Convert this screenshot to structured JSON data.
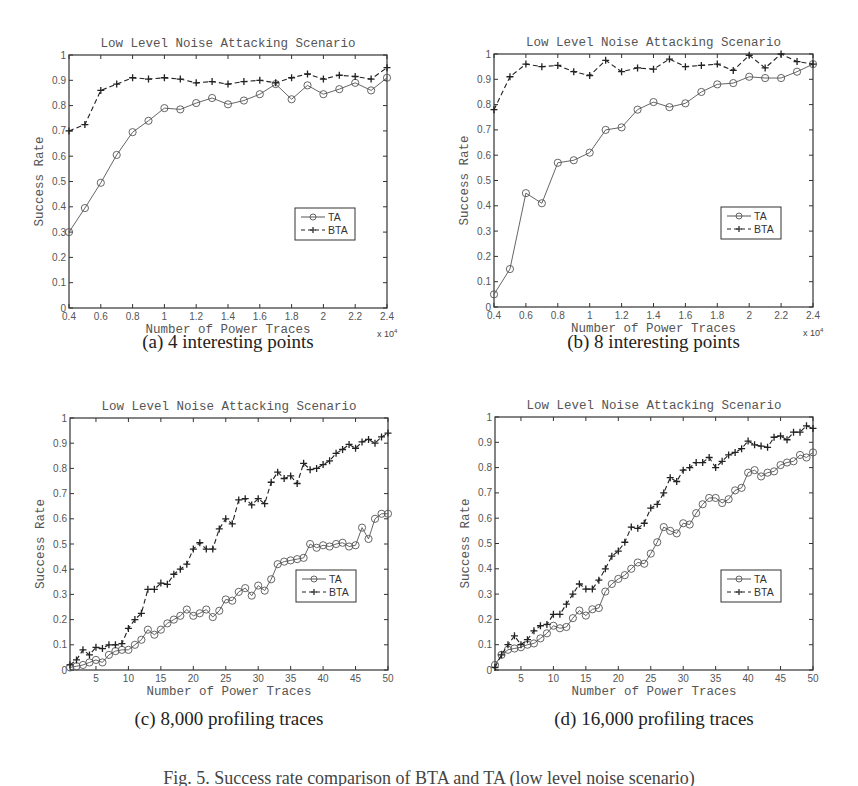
{
  "figure": {
    "caption": "Fig. 5. Success rate comparison of BTA and TA (low level noise scenario)",
    "panels": [
      {
        "id": "a",
        "caption": "(a) 4 interesting points"
      },
      {
        "id": "b",
        "caption": "(b) 8 interesting points"
      },
      {
        "id": "c",
        "caption": "(c) 8,000 profiling traces"
      },
      {
        "id": "d",
        "caption": "(d) 16,000 profiling traces"
      }
    ]
  },
  "chart_data": [
    {
      "panel": "a",
      "type": "line",
      "title": "Low Level Noise Attacking Scenario",
      "xlabel": "Number of Power Traces",
      "ylabel": "Success Rate",
      "x_multiplier_label": "x 10^4",
      "xlim": [
        0.4,
        2.4
      ],
      "ylim": [
        0,
        1
      ],
      "xticks": [
        0.4,
        0.6,
        0.8,
        1,
        1.2,
        1.4,
        1.6,
        1.8,
        2,
        2.2,
        2.4
      ],
      "yticks": [
        0,
        0.1,
        0.2,
        0.3,
        0.4,
        0.5,
        0.6,
        0.7,
        0.8,
        0.9,
        1
      ],
      "grid": false,
      "legend_position": "lower right",
      "x": [
        0.4,
        0.5,
        0.6,
        0.7,
        0.8,
        0.9,
        1.0,
        1.1,
        1.2,
        1.3,
        1.4,
        1.5,
        1.6,
        1.7,
        1.8,
        1.9,
        2.0,
        2.1,
        2.2,
        2.3,
        2.4
      ],
      "series": [
        {
          "name": "TA",
          "style": "solid-circle",
          "values": [
            0.3,
            0.395,
            0.495,
            0.605,
            0.695,
            0.74,
            0.79,
            0.785,
            0.81,
            0.83,
            0.805,
            0.82,
            0.845,
            0.885,
            0.825,
            0.88,
            0.845,
            0.865,
            0.89,
            0.86,
            0.91
          ]
        },
        {
          "name": "BTA",
          "style": "dashed-plus",
          "values": [
            0.7,
            0.725,
            0.86,
            0.885,
            0.91,
            0.905,
            0.91,
            0.905,
            0.89,
            0.895,
            0.885,
            0.895,
            0.9,
            0.89,
            0.91,
            0.925,
            0.905,
            0.92,
            0.915,
            0.905,
            0.95
          ]
        }
      ]
    },
    {
      "panel": "b",
      "type": "line",
      "title": "Low Level Noise Attacking Scenario",
      "xlabel": "Number of Power Traces",
      "ylabel": "Success Rate",
      "x_multiplier_label": "x 10^4",
      "xlim": [
        0.4,
        2.4
      ],
      "ylim": [
        0,
        1
      ],
      "xticks": [
        0.4,
        0.6,
        0.8,
        1,
        1.2,
        1.4,
        1.6,
        1.8,
        2,
        2.2,
        2.4
      ],
      "yticks": [
        0,
        0.1,
        0.2,
        0.3,
        0.4,
        0.5,
        0.6,
        0.7,
        0.8,
        0.9,
        1
      ],
      "grid": false,
      "legend_position": "lower right",
      "x": [
        0.4,
        0.5,
        0.6,
        0.7,
        0.8,
        0.9,
        1.0,
        1.1,
        1.2,
        1.3,
        1.4,
        1.5,
        1.6,
        1.7,
        1.8,
        1.9,
        2.0,
        2.1,
        2.2,
        2.3,
        2.4
      ],
      "series": [
        {
          "name": "TA",
          "style": "solid-circle",
          "values": [
            0.05,
            0.15,
            0.45,
            0.41,
            0.57,
            0.58,
            0.61,
            0.7,
            0.71,
            0.78,
            0.81,
            0.79,
            0.805,
            0.85,
            0.88,
            0.885,
            0.91,
            0.905,
            0.905,
            0.93,
            0.96
          ]
        },
        {
          "name": "BTA",
          "style": "dashed-plus",
          "values": [
            0.78,
            0.91,
            0.96,
            0.95,
            0.955,
            0.93,
            0.915,
            0.975,
            0.93,
            0.945,
            0.94,
            0.98,
            0.95,
            0.955,
            0.96,
            0.935,
            0.995,
            0.945,
            1.0,
            0.97,
            0.96
          ]
        }
      ]
    },
    {
      "panel": "c",
      "type": "line",
      "title": "Low Level Noise Attacking Scenario",
      "xlabel": "Number of Power Traces",
      "ylabel": "Success Rate",
      "xlim": [
        1,
        50
      ],
      "ylim": [
        0,
        1
      ],
      "xticks": [
        5,
        10,
        15,
        20,
        25,
        30,
        35,
        40,
        45,
        50
      ],
      "yticks": [
        0,
        0.1,
        0.2,
        0.3,
        0.4,
        0.5,
        0.6,
        0.7,
        0.8,
        0.9,
        1
      ],
      "grid": false,
      "legend_position": "lower right",
      "x": [
        1,
        2,
        3,
        4,
        5,
        6,
        7,
        8,
        9,
        10,
        11,
        12,
        13,
        14,
        15,
        16,
        17,
        18,
        19,
        20,
        21,
        22,
        23,
        24,
        25,
        26,
        27,
        28,
        29,
        30,
        31,
        32,
        33,
        34,
        35,
        36,
        37,
        38,
        39,
        40,
        41,
        42,
        43,
        44,
        45,
        46,
        47,
        48,
        49,
        50
      ],
      "series": [
        {
          "name": "TA",
          "style": "solid-circle",
          "values": [
            0.01,
            0.015,
            0.02,
            0.03,
            0.04,
            0.03,
            0.06,
            0.075,
            0.08,
            0.08,
            0.1,
            0.12,
            0.16,
            0.14,
            0.16,
            0.185,
            0.2,
            0.215,
            0.24,
            0.215,
            0.225,
            0.24,
            0.21,
            0.235,
            0.28,
            0.275,
            0.31,
            0.325,
            0.295,
            0.335,
            0.315,
            0.36,
            0.42,
            0.43,
            0.435,
            0.44,
            0.445,
            0.5,
            0.485,
            0.495,
            0.49,
            0.5,
            0.505,
            0.49,
            0.495,
            0.565,
            0.52,
            0.6,
            0.62,
            0.62
          ]
        },
        {
          "name": "BTA",
          "style": "dashed-plus",
          "values": [
            0.02,
            0.04,
            0.08,
            0.06,
            0.09,
            0.085,
            0.1,
            0.1,
            0.105,
            0.165,
            0.2,
            0.225,
            0.32,
            0.32,
            0.345,
            0.34,
            0.38,
            0.4,
            0.42,
            0.48,
            0.505,
            0.48,
            0.48,
            0.56,
            0.6,
            0.58,
            0.675,
            0.68,
            0.655,
            0.68,
            0.66,
            0.745,
            0.785,
            0.76,
            0.77,
            0.74,
            0.82,
            0.795,
            0.8,
            0.815,
            0.83,
            0.86,
            0.875,
            0.895,
            0.88,
            0.905,
            0.915,
            0.9,
            0.925,
            0.94
          ]
        }
      ]
    },
    {
      "panel": "d",
      "type": "line",
      "title": "Low Level Noise Attacking Scenario",
      "xlabel": "Number of Power Traces",
      "ylabel": "Success Rate",
      "xlim": [
        1,
        50
      ],
      "ylim": [
        0,
        1
      ],
      "xticks": [
        5,
        10,
        15,
        20,
        25,
        30,
        35,
        40,
        45,
        50
      ],
      "yticks": [
        0,
        0.1,
        0.2,
        0.3,
        0.4,
        0.5,
        0.6,
        0.7,
        0.8,
        0.9,
        1
      ],
      "grid": false,
      "legend_position": "lower right",
      "x": [
        1,
        2,
        3,
        4,
        5,
        6,
        7,
        8,
        9,
        10,
        11,
        12,
        13,
        14,
        15,
        16,
        17,
        18,
        19,
        20,
        21,
        22,
        23,
        24,
        25,
        26,
        27,
        28,
        29,
        30,
        31,
        32,
        33,
        34,
        35,
        36,
        37,
        38,
        39,
        40,
        41,
        42,
        43,
        44,
        45,
        46,
        47,
        48,
        49,
        50
      ],
      "series": [
        {
          "name": "TA",
          "style": "solid-circle",
          "values": [
            0.02,
            0.06,
            0.08,
            0.085,
            0.09,
            0.1,
            0.105,
            0.125,
            0.145,
            0.175,
            0.165,
            0.17,
            0.205,
            0.235,
            0.215,
            0.24,
            0.245,
            0.31,
            0.34,
            0.36,
            0.375,
            0.4,
            0.425,
            0.42,
            0.46,
            0.505,
            0.565,
            0.55,
            0.54,
            0.58,
            0.575,
            0.62,
            0.655,
            0.68,
            0.68,
            0.66,
            0.675,
            0.71,
            0.72,
            0.78,
            0.79,
            0.765,
            0.78,
            0.785,
            0.81,
            0.82,
            0.825,
            0.85,
            0.84,
            0.86
          ]
        },
        {
          "name": "BTA",
          "style": "dashed-plus",
          "values": [
            0.01,
            0.06,
            0.1,
            0.135,
            0.1,
            0.12,
            0.155,
            0.175,
            0.18,
            0.22,
            0.22,
            0.26,
            0.3,
            0.34,
            0.32,
            0.32,
            0.355,
            0.4,
            0.45,
            0.47,
            0.505,
            0.565,
            0.56,
            0.58,
            0.64,
            0.655,
            0.7,
            0.76,
            0.745,
            0.79,
            0.8,
            0.82,
            0.82,
            0.84,
            0.8,
            0.825,
            0.85,
            0.86,
            0.875,
            0.905,
            0.89,
            0.885,
            0.88,
            0.92,
            0.925,
            0.91,
            0.94,
            0.94,
            0.965,
            0.955
          ]
        }
      ]
    }
  ],
  "layout": {
    "panels": [
      {
        "left": 69,
        "top": 55,
        "right": 387,
        "bottom": 308
      },
      {
        "left": 494,
        "top": 54,
        "right": 813,
        "bottom": 307
      },
      {
        "left": 70,
        "top": 418,
        "right": 388,
        "bottom": 670
      },
      {
        "left": 495,
        "top": 417,
        "right": 813,
        "bottom": 670
      }
    ],
    "subcaption_y": [
      331,
      331,
      708,
      708
    ],
    "colors": {
      "TA": "#555555",
      "BTA": "#222222",
      "axis": "#333333"
    }
  }
}
